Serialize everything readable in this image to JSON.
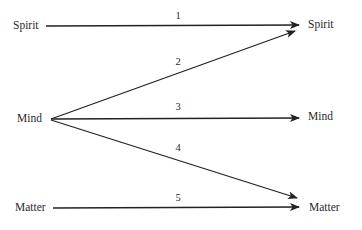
{
  "diagram": {
    "type": "flow-mapping",
    "left_nodes": [
      {
        "id": "spirit_src",
        "label": "Spirit"
      },
      {
        "id": "mind_src",
        "label": "Mind"
      },
      {
        "id": "matter_src",
        "label": "Matter"
      }
    ],
    "right_nodes": [
      {
        "id": "spirit_dst",
        "label": "Spirit"
      },
      {
        "id": "mind_dst",
        "label": "Mind"
      },
      {
        "id": "matter_dst",
        "label": "Matter"
      }
    ],
    "edges": [
      {
        "number": "1",
        "from": "Spirit",
        "to": "Spirit"
      },
      {
        "number": "2",
        "from": "Mind",
        "to": "Spirit"
      },
      {
        "number": "3",
        "from": "Mind",
        "to": "Mind"
      },
      {
        "number": "4",
        "from": "Mind",
        "to": "Matter"
      },
      {
        "number": "5",
        "from": "Matter",
        "to": "Matter"
      }
    ],
    "colors": {
      "line": "#222222",
      "text": "#2a2a2a",
      "background": "#ffffff"
    }
  }
}
